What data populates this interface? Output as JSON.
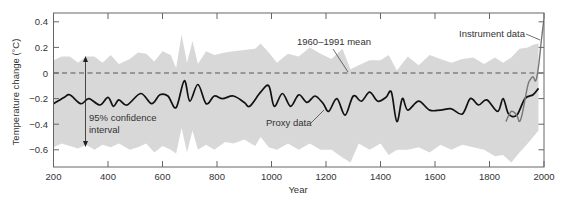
{
  "chart_data": {
    "type": "line",
    "title": "",
    "xlabel": "Year",
    "ylabel": "Temperature change (°C)",
    "xlim": [
      200,
      2000
    ],
    "ylim": [
      -0.72,
      0.43
    ],
    "grid": false,
    "legend": null,
    "x_ticks": [
      200,
      400,
      600,
      800,
      1000,
      1200,
      1400,
      1600,
      1800,
      2000
    ],
    "x_tick_labels": [
      "200",
      "400",
      "600",
      "800",
      "1000",
      "1200",
      "1400",
      "1600",
      "1800",
      "2000"
    ],
    "y_ticks": [
      0.4,
      0.2,
      0,
      -0.2,
      -0.4,
      -0.6
    ],
    "y_tick_labels": [
      "0.4",
      "0.2",
      "0",
      "−0.2",
      "−0.4",
      "−0.6"
    ],
    "reference_line": {
      "label": "1960–1991 mean",
      "value": 0,
      "style": "dashed"
    },
    "series": [
      {
        "name": "Proxy data",
        "color": "#111111",
        "x": [
          200,
          240,
          260,
          300,
          330,
          370,
          400,
          420,
          440,
          470,
          520,
          560,
          590,
          620,
          650,
          680,
          700,
          730,
          760,
          790,
          820,
          860,
          900,
          920,
          960,
          990,
          1010,
          1040,
          1070,
          1100,
          1130,
          1160,
          1190,
          1210,
          1240,
          1270,
          1300,
          1330,
          1360,
          1390,
          1420,
          1440,
          1460,
          1480,
          1500,
          1540,
          1580,
          1620,
          1660,
          1700,
          1730,
          1760,
          1790,
          1830,
          1850,
          1870,
          1900,
          1930,
          1960,
          1980
        ],
        "values": [
          -0.24,
          -0.19,
          -0.17,
          -0.24,
          -0.2,
          -0.25,
          -0.19,
          -0.26,
          -0.21,
          -0.25,
          -0.16,
          -0.24,
          -0.17,
          -0.18,
          -0.27,
          -0.06,
          -0.22,
          -0.09,
          -0.24,
          -0.18,
          -0.2,
          -0.18,
          -0.23,
          -0.26,
          -0.15,
          -0.1,
          -0.26,
          -0.16,
          -0.26,
          -0.17,
          -0.23,
          -0.18,
          -0.24,
          -0.3,
          -0.2,
          -0.33,
          -0.18,
          -0.22,
          -0.15,
          -0.22,
          -0.19,
          -0.15,
          -0.38,
          -0.2,
          -0.29,
          -0.22,
          -0.29,
          -0.29,
          -0.28,
          -0.32,
          -0.2,
          -0.25,
          -0.21,
          -0.3,
          -0.2,
          -0.32,
          -0.33,
          -0.2,
          -0.17,
          -0.12
        ]
      },
      {
        "name": "Instrument data",
        "color": "#777777",
        "x": [
          1860,
          1880,
          1900,
          1910,
          1920,
          1940,
          1950,
          1960,
          1970,
          1980,
          1990,
          2000
        ],
        "values": [
          -0.38,
          -0.3,
          -0.33,
          -0.38,
          -0.32,
          -0.1,
          -0.05,
          -0.03,
          -0.06,
          0.05,
          0.25,
          0.42
        ]
      },
      {
        "name": "95% confidence interval",
        "type": "band",
        "color": "#d8d8d8",
        "x": [
          200,
          230,
          260,
          290,
          320,
          350,
          380,
          410,
          440,
          480,
          510,
          540,
          570,
          600,
          630,
          650,
          670,
          690,
          710,
          730,
          760,
          790,
          830,
          860,
          900,
          940,
          960,
          990,
          1020,
          1060,
          1100,
          1140,
          1180,
          1220,
          1260,
          1290,
          1320,
          1360,
          1400,
          1430,
          1460,
          1500,
          1540,
          1580,
          1620,
          1660,
          1700,
          1740,
          1780,
          1820,
          1850,
          1880,
          1910,
          1940,
          1960,
          1980
        ],
        "upper": [
          0.1,
          0.13,
          0.13,
          0.08,
          0.13,
          0.13,
          0.08,
          0.14,
          0.07,
          0.11,
          0.16,
          0.15,
          0.09,
          0.17,
          0.14,
          0.04,
          0.3,
          0.08,
          0.25,
          0.07,
          0.17,
          0.14,
          0.16,
          0.17,
          0.18,
          0.19,
          0.23,
          0.16,
          0.08,
          0.15,
          0.13,
          0.2,
          0.15,
          0.11,
          0.19,
          0.03,
          0.06,
          0.1,
          0.1,
          0.14,
          0.02,
          0.13,
          0.06,
          0.14,
          0.11,
          0.08,
          0.11,
          0.12,
          0.07,
          0.12,
          0.08,
          0.12,
          0.19,
          0.2,
          0.22,
          0.23
        ],
        "lower": [
          -0.58,
          -0.55,
          -0.57,
          -0.59,
          -0.56,
          -0.6,
          -0.56,
          -0.58,
          -0.55,
          -0.6,
          -0.58,
          -0.55,
          -0.62,
          -0.57,
          -0.6,
          -0.63,
          -0.43,
          -0.62,
          -0.45,
          -0.6,
          -0.56,
          -0.6,
          -0.54,
          -0.55,
          -0.52,
          -0.57,
          -0.5,
          -0.58,
          -0.6,
          -0.55,
          -0.6,
          -0.55,
          -0.6,
          -0.6,
          -0.66,
          -0.7,
          -0.55,
          -0.6,
          -0.55,
          -0.64,
          -0.6,
          -0.6,
          -0.58,
          -0.62,
          -0.56,
          -0.6,
          -0.56,
          -0.58,
          -0.6,
          -0.65,
          -0.64,
          -0.7,
          -0.62,
          -0.55,
          -0.5,
          -0.45
        ]
      }
    ],
    "annotations": [
      {
        "text": "1960–1991 mean",
        "points_to": [
          1290,
          0
        ]
      },
      {
        "text": "Instrument data",
        "points_to": [
          1990,
          0.33
        ]
      },
      {
        "text": "Proxy data",
        "points_to": [
          1200,
          -0.26
        ]
      },
      {
        "text": "95% confidence",
        "text2": "interval",
        "arrow": "double vertical",
        "x": 310,
        "from": 0.13,
        "to": -0.57
      }
    ]
  },
  "labels": {
    "ylabel": "Temperature change (°C)",
    "xlabel": "Year",
    "mean_label": "1960–1991 mean",
    "instrument_label": "Instrument data",
    "proxy_label": "Proxy data",
    "ci_label_line1": "95% confidence",
    "ci_label_line2": "interval"
  }
}
